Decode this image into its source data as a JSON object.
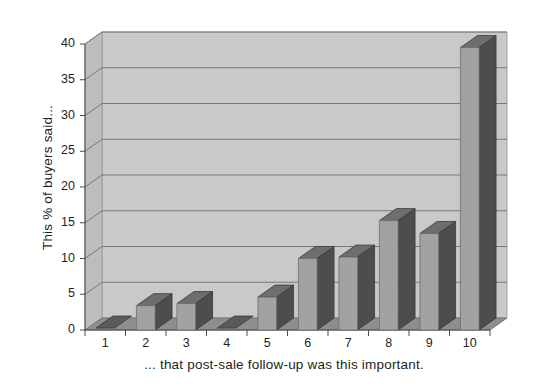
{
  "chart_data": {
    "type": "bar",
    "title": "",
    "subtitle": "",
    "xlabel": "... that post-sale follow-up was this important.",
    "ylabel": "This % of buyers said...",
    "categories": [
      "1",
      "2",
      "3",
      "4",
      "5",
      "6",
      "7",
      "8",
      "9",
      "10"
    ],
    "values": [
      0.2,
      3.4,
      3.7,
      0.2,
      4.6,
      10.0,
      10.2,
      15.3,
      13.5,
      39.5
    ],
    "series": [
      {
        "name": "Percent of buyers",
        "values": [
          0.2,
          3.4,
          3.7,
          0.2,
          4.6,
          10.0,
          10.2,
          15.3,
          13.5,
          39.5
        ]
      }
    ],
    "ylim": [
      0,
      40
    ],
    "ytick_values": [
      0,
      5,
      10,
      15,
      20,
      25,
      30,
      35,
      40
    ],
    "ytick_labels": [
      "0",
      "5",
      "10",
      "15",
      "20",
      "25",
      "30",
      "35",
      "40"
    ],
    "xtick_labels": [
      "1",
      "2",
      "3",
      "4",
      "5",
      "6",
      "7",
      "8",
      "9",
      "10"
    ],
    "grid": true,
    "grid_axis": "y",
    "legend": false,
    "legend_position": "none",
    "style": "3d",
    "colors": {
      "bar_face": "#a2a2a2",
      "bar_side": "#4d4d4d",
      "bar_top": "#6e6e6e",
      "back_wall": "#c9c9c9",
      "side_wall": "#bdbdbd",
      "floor": "#8e8e8e",
      "gridline": "#6f6f6f",
      "text": "#231f20",
      "background": "#ffffff"
    }
  }
}
